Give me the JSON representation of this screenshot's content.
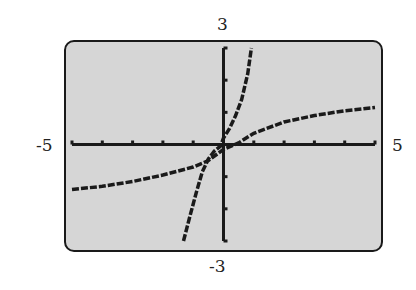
{
  "window": {
    "xmin": "-5",
    "xmax": "5",
    "ymin": "-3",
    "ymax": "3"
  },
  "colors": {
    "screen": "#d6d6d6",
    "ink": "#1a1a1a"
  },
  "chart_data": {
    "type": "line",
    "title": "",
    "xlabel": "",
    "ylabel": "",
    "xlim": [
      -5,
      5
    ],
    "ylim": [
      -3,
      3
    ],
    "x_ticks_every": 1,
    "y_ticks_every": 1,
    "grid": false,
    "series": [
      {
        "name": "steep curve",
        "x": [
          -1.32,
          -1.1,
          -0.9,
          -0.7,
          -0.5,
          -0.3,
          -0.1,
          0.0,
          0.2,
          0.4,
          0.6,
          0.8,
          0.92
        ],
        "y": [
          -3.0,
          -2.2,
          -1.5,
          -0.85,
          -0.45,
          -0.2,
          -0.05,
          0.2,
          0.5,
          0.9,
          1.4,
          2.2,
          3.0
        ]
      },
      {
        "name": "flat curve",
        "x": [
          -5,
          -4,
          -3,
          -2,
          -1,
          -0.5,
          0,
          0.5,
          1,
          2,
          3,
          4,
          5
        ],
        "y": [
          -1.4,
          -1.3,
          -1.15,
          -0.95,
          -0.7,
          -0.5,
          -0.15,
          0.05,
          0.35,
          0.7,
          0.9,
          1.05,
          1.15
        ]
      }
    ]
  }
}
